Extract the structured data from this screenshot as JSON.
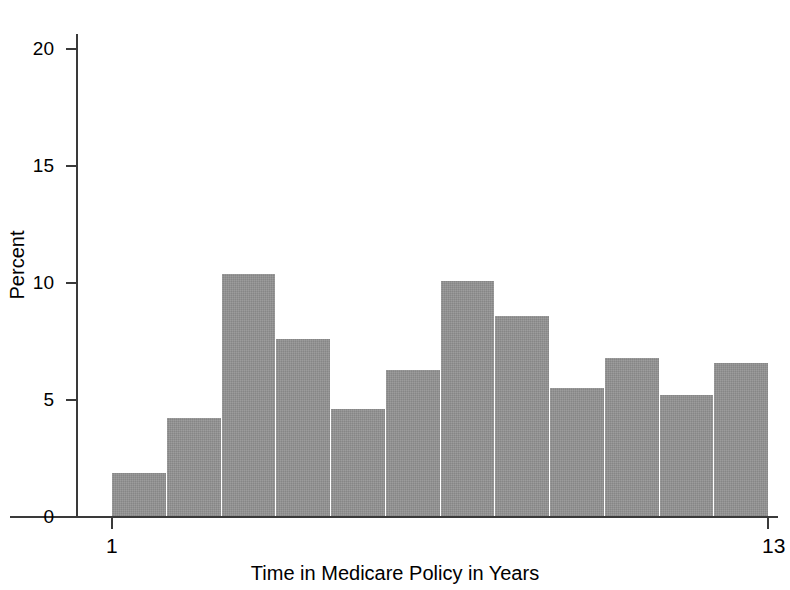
{
  "chart_data": {
    "type": "bar",
    "title": "",
    "subtitle": "",
    "xlabel": "Time in Medicare Policy in Years",
    "ylabel": "Percent",
    "categories": [
      "1",
      "2",
      "3",
      "4",
      "5",
      "6",
      "7",
      "8",
      "9",
      "10",
      "11",
      "12"
    ],
    "values": [
      1.9,
      4.25,
      10.4,
      7.6,
      4.6,
      6.3,
      10.1,
      8.6,
      5.5,
      6.8,
      5.2,
      6.6
    ],
    "ylim": [
      0,
      22
    ],
    "xlim": [
      1,
      13
    ],
    "y_ticks": [
      0,
      5,
      10,
      15,
      20
    ],
    "y_tick_labels": [
      "0",
      "5",
      "10",
      "15",
      "20"
    ],
    "x_ticks": [
      1,
      13
    ],
    "x_tick_labels": [
      "1",
      "13"
    ],
    "grid": false,
    "legend": false,
    "legend_position": "none",
    "bar_color": "#939393",
    "axis_color": "#3a3a3a",
    "background": "#ffffff"
  }
}
